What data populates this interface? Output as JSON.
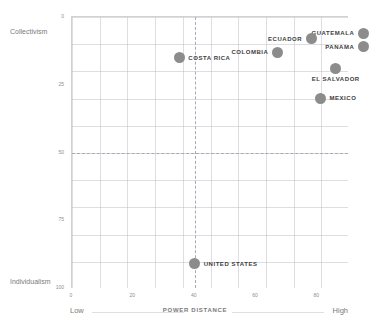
{
  "chart_data": {
    "type": "scatter",
    "title": "",
    "xlabel": "POWER DISTANCE",
    "ylabel": "",
    "xlim": [
      0,
      90
    ],
    "ylim": [
      0,
      100
    ],
    "y_inverted": true,
    "grid": true,
    "legend": "none",
    "x_ticks": [
      "0",
      "20",
      "40",
      "60",
      "80"
    ],
    "x_tick_values": [
      0,
      20,
      40,
      60,
      80
    ],
    "y_ticks": [
      "0",
      "25",
      "50",
      "75",
      "100"
    ],
    "y_tick_values": [
      0,
      25,
      50,
      75,
      100
    ],
    "axis_endpoints": {
      "x_low": "Low",
      "x_high": "High",
      "y_top": "Collectivism",
      "y_bottom": "Individualism"
    },
    "quadrant_dividers": {
      "x": 40,
      "y": 50
    },
    "point_color": "#8c8c8c",
    "label_color": "#3d3d3d",
    "grid_color": "#b0b0ba",
    "points": [
      {
        "name": "GUATEMALA",
        "x": 95,
        "y": 6,
        "label_side": "left"
      },
      {
        "name": "ECUADOR",
        "x": 78,
        "y": 8,
        "label_side": "left"
      },
      {
        "name": "PANAMA",
        "x": 95,
        "y": 11,
        "label_side": "left"
      },
      {
        "name": "COLOMBIA",
        "x": 67,
        "y": 13,
        "label_side": "left"
      },
      {
        "name": "EL SALVADOR",
        "x": 86,
        "y": 19,
        "label_side": "below"
      },
      {
        "name": "COSTA RICA",
        "x": 35,
        "y": 15,
        "label_side": "right"
      },
      {
        "name": "MEXICO",
        "x": 81,
        "y": 30,
        "label_side": "right"
      },
      {
        "name": "UNITED STATES",
        "x": 40,
        "y": 91,
        "label_side": "right"
      }
    ]
  }
}
